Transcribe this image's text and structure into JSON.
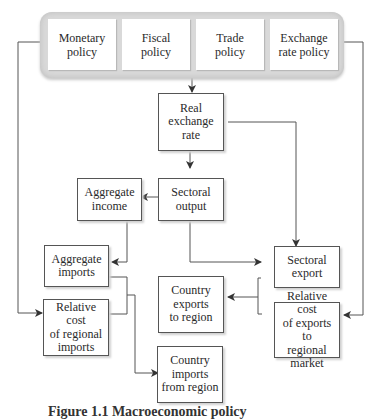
{
  "diagram": {
    "policy_group": {
      "boxes": [
        {
          "id": "monetary",
          "label": "Monetary\npolicy"
        },
        {
          "id": "fiscal",
          "label": "Fiscal\npolicy"
        },
        {
          "id": "trade",
          "label": "Trade\npolicy"
        },
        {
          "id": "exchange",
          "label": "Exchange\nrate policy"
        }
      ]
    },
    "nodes": {
      "real_exchange_rate": "Real\nexchange\nrate",
      "sectoral_output": "Sectoral\noutput",
      "aggregate_income": "Aggregate\nincome",
      "aggregate_imports": "Aggregate\nimports",
      "relative_cost_regional_imports": "Relative cost\nof regional\nimports",
      "sectoral_export": "Sectoral\nexport",
      "country_exports_to_region": "Country\nexports\nto region",
      "relative_cost_exports": "Relative cost\nof exports to\nregional\nmarket",
      "country_imports_from_region": "Country\nimports\nfrom region"
    },
    "edges": [
      {
        "from": "policy_group",
        "to": "real_exchange_rate"
      },
      {
        "from": "real_exchange_rate",
        "to": "sectoral_output"
      },
      {
        "from": "real_exchange_rate",
        "to": "sectoral_export"
      },
      {
        "from": "sectoral_output",
        "to": "aggregate_income"
      },
      {
        "from": "sectoral_output",
        "to": "sectoral_export"
      },
      {
        "from": "aggregate_income",
        "to": "aggregate_imports"
      },
      {
        "from": "monetary",
        "to": "relative_cost_regional_imports"
      },
      {
        "from": "exchange",
        "to": "relative_cost_exports"
      },
      {
        "from": "aggregate_imports + relative_cost_regional_imports",
        "to": "country_imports_from_region"
      },
      {
        "from": "sectoral_export + relative_cost_exports",
        "to": "country_exports_to_region"
      }
    ],
    "caption": {
      "figure_number": "Figure 1.1",
      "text": "Macroeconomic policy"
    }
  }
}
